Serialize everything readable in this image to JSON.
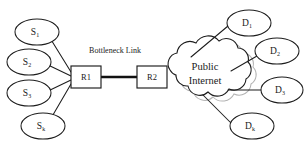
{
  "figure": {
    "background_color": "#ffffff",
    "line_color": "#1d1d1d",
    "shadow_color": "#b3b3b3"
  },
  "captions": {
    "bottleneck_link": "Bottleneck Link"
  },
  "cloud": {
    "label_line1": "Public",
    "label_line2": "Internet"
  },
  "routers": [
    {
      "id": "r1",
      "label": "R1"
    },
    {
      "id": "r2",
      "label": "R2"
    }
  ],
  "sources": [
    {
      "id": "s1",
      "base": "S",
      "sub": "1"
    },
    {
      "id": "s2",
      "base": "S",
      "sub": "2"
    },
    {
      "id": "s3",
      "base": "S",
      "sub": "3"
    },
    {
      "id": "sk",
      "base": "S",
      "sub": "k"
    }
  ],
  "destinations": [
    {
      "id": "d1",
      "base": "D",
      "sub": "1"
    },
    {
      "id": "d2",
      "base": "D",
      "sub": "2"
    },
    {
      "id": "d3",
      "base": "D",
      "sub": "3"
    },
    {
      "id": "dk",
      "base": "D",
      "sub": "k"
    }
  ]
}
